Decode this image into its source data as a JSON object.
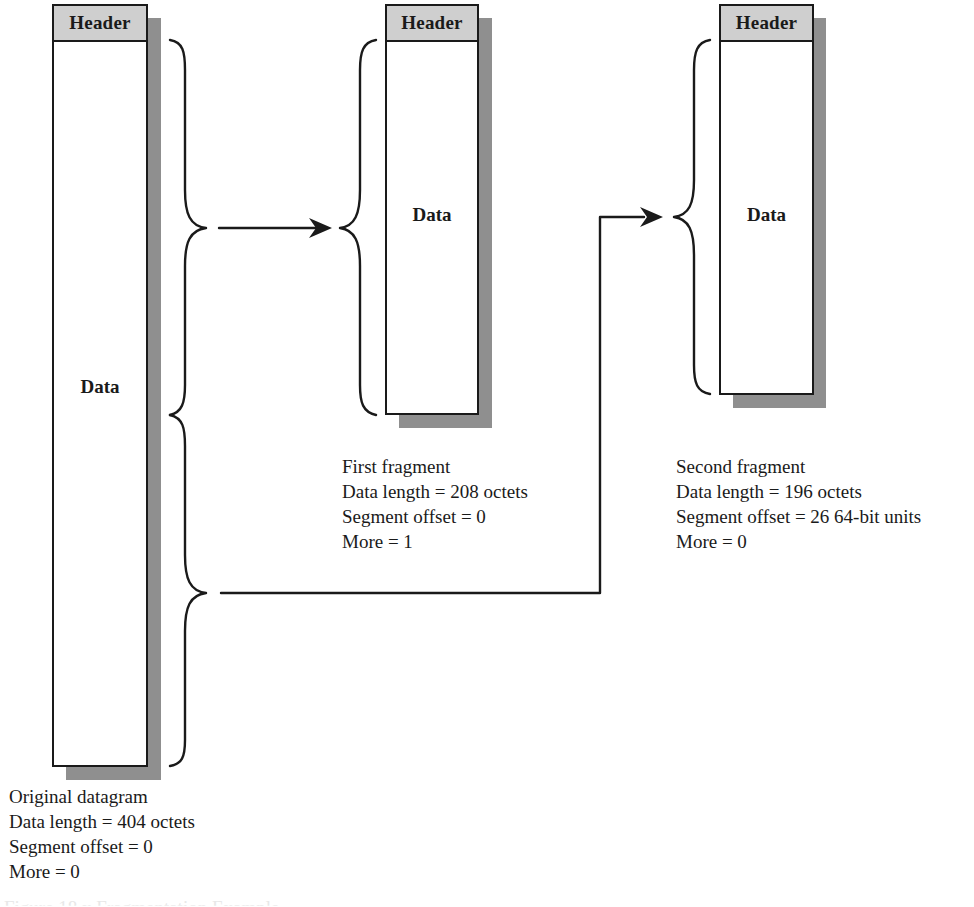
{
  "diagram": {
    "type": "ip-fragmentation",
    "colors": {
      "stroke": "#1a1a1a",
      "header_fill": "#cfcfcf",
      "shadow": "#8f8f8f",
      "background": "#ffffff"
    },
    "original": {
      "header_label": "Header",
      "data_label": "Data",
      "caption": {
        "title": "Original datagram",
        "data_length": "Data length = 404 octets",
        "segment_offset": "Segment offset = 0",
        "more": "More = 0"
      }
    },
    "first_fragment": {
      "header_label": "Header",
      "data_label": "Data",
      "caption": {
        "title": "First fragment",
        "data_length": "Data length = 208 octets",
        "segment_offset": "Segment offset = 0",
        "more": "More = 1"
      }
    },
    "second_fragment": {
      "header_label": "Header",
      "data_label": "Data",
      "caption": {
        "title": "Second fragment",
        "data_length": "Data length = 196 octets",
        "segment_offset": "Segment offset = 26 64-bit units",
        "more": "More = 0"
      }
    },
    "figure_caption": "Figure 18.x  Fragmentation Example"
  }
}
